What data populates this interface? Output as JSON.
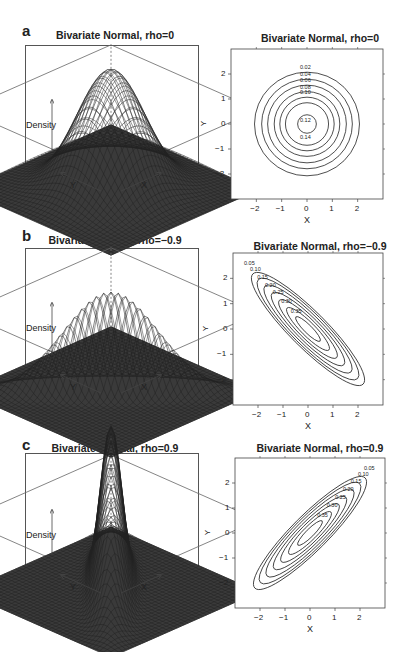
{
  "panels": [
    {
      "letter": "a",
      "title3d": "Bivariate Normal, rho=0",
      "titleContour": "Bivariate Normal, rho=0",
      "rho": 0
    },
    {
      "letter": "b",
      "title3d": "Bivariate Normal, rho=−0.9",
      "titleContour": "Bivariate Normal, rho=−0.9",
      "rho": -0.9
    },
    {
      "letter": "c",
      "title3d": "Bivariate Normal, rho=0.9",
      "titleContour": "Bivariate Normal, rho=0.9",
      "rho": 0.9
    }
  ],
  "axis3d": {
    "z": "Density",
    "x": "X",
    "y": "Y"
  },
  "axis2d": {
    "xlabel": "X",
    "ylabel": "Y",
    "ticks": [
      "−2",
      "−1",
      "0",
      "1",
      "2"
    ]
  },
  "chart_data": [
    {
      "type": "surface",
      "title": "Bivariate Normal, rho=0",
      "xlabel": "X",
      "ylabel": "Y",
      "zlabel": "Density",
      "rho": 0
    },
    {
      "type": "contour",
      "title": "Bivariate Normal, rho=0",
      "xlabel": "X",
      "ylabel": "Y",
      "xlim": [
        -3,
        3
      ],
      "ylim": [
        -3,
        3
      ],
      "ticks": [
        -2,
        -1,
        0,
        1,
        2
      ],
      "contour_labels": [
        "0.02",
        "0.04",
        "0.06",
        "0.08",
        "0.10",
        "0.12",
        "0.14"
      ]
    },
    {
      "type": "surface",
      "title": "Bivariate Normal, rho=-0.9",
      "xlabel": "X",
      "ylabel": "Y",
      "zlabel": "Density",
      "rho": -0.9
    },
    {
      "type": "contour",
      "title": "Bivariate Normal, rho=-0.9",
      "xlabel": "X",
      "ylabel": "Y",
      "xlim": [
        -3,
        3
      ],
      "ylim": [
        -3,
        3
      ],
      "ticks": [
        -2,
        -1,
        0,
        1,
        2
      ],
      "contour_labels": [
        "0.05",
        "0.10",
        "0.15",
        "0.20",
        "0.25",
        "0.30",
        "0.35"
      ]
    },
    {
      "type": "surface",
      "title": "Bivariate Normal, rho=0.9",
      "xlabel": "X",
      "ylabel": "Y",
      "zlabel": "Density",
      "rho": 0.9
    },
    {
      "type": "contour",
      "title": "Bivariate Normal, rho=0.9",
      "xlabel": "X",
      "ylabel": "Y",
      "xlim": [
        -3,
        3
      ],
      "ylim": [
        -3,
        3
      ],
      "ticks": [
        -2,
        -1,
        0,
        1,
        2
      ],
      "contour_labels": [
        "0.05",
        "0.10",
        "0.15",
        "0.20",
        "0.25",
        "0.30",
        "0.35"
      ]
    }
  ]
}
